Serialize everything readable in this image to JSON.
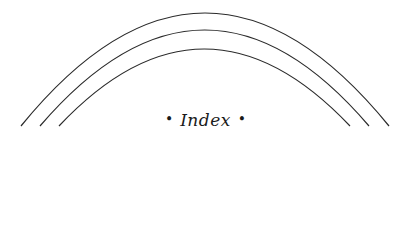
{
  "heading": {
    "title": "Index",
    "left_ornament": "•",
    "right_ornament": "•"
  },
  "decoration": {
    "arc_count": 3,
    "stroke_color": "#2a2a2a"
  }
}
